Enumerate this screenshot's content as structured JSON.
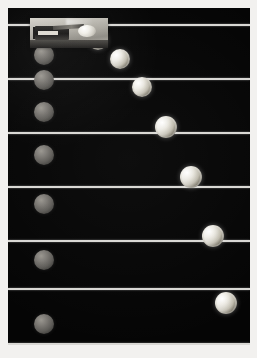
{
  "image": {
    "kind": "stroboscopic-photograph",
    "subject": "Simultaneous free-fall and horizontal projectile motion",
    "border_color": "#f2f1ef",
    "background_color": "#050505",
    "reference_line_color": "#d9d8d4",
    "lit_ball_color": "#eceae3",
    "dim_ball_color": "#7c7974",
    "alt_text": "Strobe photo: a ball dropped straight down and a ball launched horizontally fall side by side, crossing the same horizontal reference lines at the same instants."
  },
  "plate": {
    "left": 8,
    "top": 8,
    "width": 242,
    "height": 337
  },
  "launcher": {
    "label": "spring-launcher-apparatus",
    "left": 22,
    "top": 10,
    "width": 78,
    "height": 30
  },
  "reference_lines": [
    {
      "label": "reference-line-1",
      "y": 16
    },
    {
      "label": "reference-line-2",
      "y": 70
    },
    {
      "label": "reference-line-3",
      "y": 124
    },
    {
      "label": "reference-line-4",
      "y": 178
    },
    {
      "label": "reference-line-5",
      "y": 232
    },
    {
      "label": "reference-line-6",
      "y": 280
    },
    {
      "label": "reference-line-7",
      "y": 335
    }
  ],
  "chart_data": {
    "type": "scatter",
    "xlabel": "horizontal position (px)",
    "ylabel": "vertical position (px, downward)",
    "xlim": [
      0,
      242
    ],
    "ylim": [
      0,
      337
    ],
    "grid": true,
    "grid_lines_y": [
      16,
      70,
      124,
      178,
      232,
      280,
      335
    ],
    "legend_position": "none",
    "series": [
      {
        "name": "dropped-ball",
        "style": "dim",
        "points": [
          {
            "t": 0,
            "x": 36,
            "y": 30,
            "r": 10
          },
          {
            "t": 1,
            "x": 36,
            "y": 47,
            "r": 10
          },
          {
            "t": 2,
            "x": 36,
            "y": 72,
            "r": 10
          },
          {
            "t": 3,
            "x": 36,
            "y": 104,
            "r": 10
          },
          {
            "t": 4,
            "x": 36,
            "y": 147,
            "r": 10
          },
          {
            "t": 5,
            "x": 36,
            "y": 196,
            "r": 10
          },
          {
            "t": 6,
            "x": 36,
            "y": 252,
            "r": 10
          },
          {
            "t": 7,
            "x": 36,
            "y": 316,
            "r": 10
          }
        ]
      },
      {
        "name": "projectile-ball",
        "style": "lit",
        "points": [
          {
            "t": 0,
            "x": 62,
            "y": 22,
            "r": 10
          },
          {
            "t": 1,
            "x": 90,
            "y": 32,
            "r": 10
          },
          {
            "t": 2,
            "x": 112,
            "y": 51,
            "r": 10
          },
          {
            "t": 3,
            "x": 134,
            "y": 79,
            "r": 10
          },
          {
            "t": 4,
            "x": 158,
            "y": 119,
            "r": 11
          },
          {
            "t": 5,
            "x": 183,
            "y": 169,
            "r": 11
          },
          {
            "t": 6,
            "x": 205,
            "y": 228,
            "r": 11
          },
          {
            "t": 7,
            "x": 218,
            "y": 295,
            "r": 11
          }
        ]
      }
    ],
    "annotations": [
      "Both balls cross each horizontal reference wire at the same flash.",
      "Horizontal spacing of the launched ball is constant; vertical spacing grows as t squared."
    ]
  }
}
